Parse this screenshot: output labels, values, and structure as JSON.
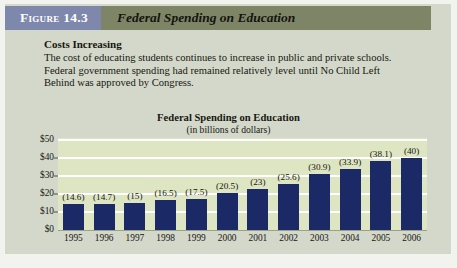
{
  "figure": {
    "number_label": "Figure 14.3",
    "title": "Federal Spending on Education"
  },
  "caption": {
    "heading": "Costs Increasing",
    "line1": "The cost of educating students continues to increase in public and private schools.",
    "line2": "Federal government spending had remained relatively level until No Child Left",
    "line3": "Behind was approved by Congress."
  },
  "colors": {
    "figure_number_box": "#7d88ac",
    "header_band": "#7e8566",
    "page_background": "#d3d8cb",
    "plot_background": "#dde5c2",
    "bar": "#1b2a66",
    "gridline": "#ffffff"
  },
  "chart_data": {
    "type": "bar",
    "title": "Federal Spending on Education",
    "subtitle": "(in billions of dollars)",
    "xlabel": "",
    "ylabel": "",
    "categories": [
      "1995",
      "1996",
      "1997",
      "1998",
      "1999",
      "2000",
      "2001",
      "2002",
      "2003",
      "2004",
      "2005",
      "2006"
    ],
    "values": [
      14.6,
      14.7,
      15,
      16.5,
      17.5,
      20.5,
      23,
      25.6,
      30.9,
      33.9,
      38.1,
      40
    ],
    "data_labels": [
      "(14.6)",
      "(14.7)",
      "(15)",
      "(16.5)",
      "(17.5)",
      "(20.5)",
      "(23)",
      "(25.6)",
      "(30.9)",
      "(33.9)",
      "(38.1)",
      "(40)"
    ],
    "ylim": [
      0,
      50
    ],
    "yticks": [
      0,
      10,
      20,
      30,
      40,
      50
    ],
    "ytick_labels": [
      "$0",
      "$10",
      "$20",
      "$30",
      "$40",
      "$50"
    ],
    "grid": true,
    "grid_axis": "y",
    "legend": false
  }
}
